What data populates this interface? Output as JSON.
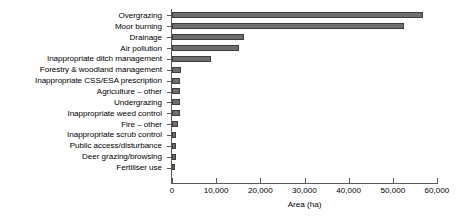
{
  "chart_data": {
    "type": "bar",
    "orientation": "horizontal",
    "title": "",
    "subtitle": "",
    "xlabel": "Area (ha)",
    "ylabel": "",
    "xlim": [
      0,
      60000
    ],
    "ylim": null,
    "grid": false,
    "legend": null,
    "legend_position": "none",
    "xticks": [
      0,
      10000,
      20000,
      30000,
      40000,
      50000,
      60000
    ],
    "xtick_labels": [
      "0",
      "10,000",
      "20,000",
      "30,000",
      "40,000",
      "50,000",
      "60,000"
    ],
    "categories": [
      "Overgrazing",
      "Moor burning",
      "Drainage",
      "Air pollution",
      "Inappropriate ditch management",
      "Forestry & woodland management",
      "Inappropriate CSS/ESA prescription",
      "Agriculture – other",
      "Undergrazing",
      "Inappropriate weed control",
      "Fire – other",
      "Inappropriate scrub control",
      "Public access/disturbance",
      "Deer grazing/browsing",
      "Fertiliser use"
    ],
    "values": [
      56800,
      52500,
      16300,
      15200,
      8800,
      2000,
      1800,
      1900,
      1900,
      1900,
      1400,
      900,
      900,
      800,
      600
    ],
    "series": [
      {
        "name": "Area (ha)",
        "values": [
          56800,
          52500,
          16300,
          15200,
          8800,
          2000,
          1800,
          1900,
          1900,
          1900,
          1400,
          900,
          900,
          800,
          600
        ]
      }
    ],
    "bar_fill_color": "#6e6e6e",
    "bar_edge_color": "#3d3d3d",
    "axis_color": "#5a5a5a",
    "background_color": "#ffffff"
  }
}
